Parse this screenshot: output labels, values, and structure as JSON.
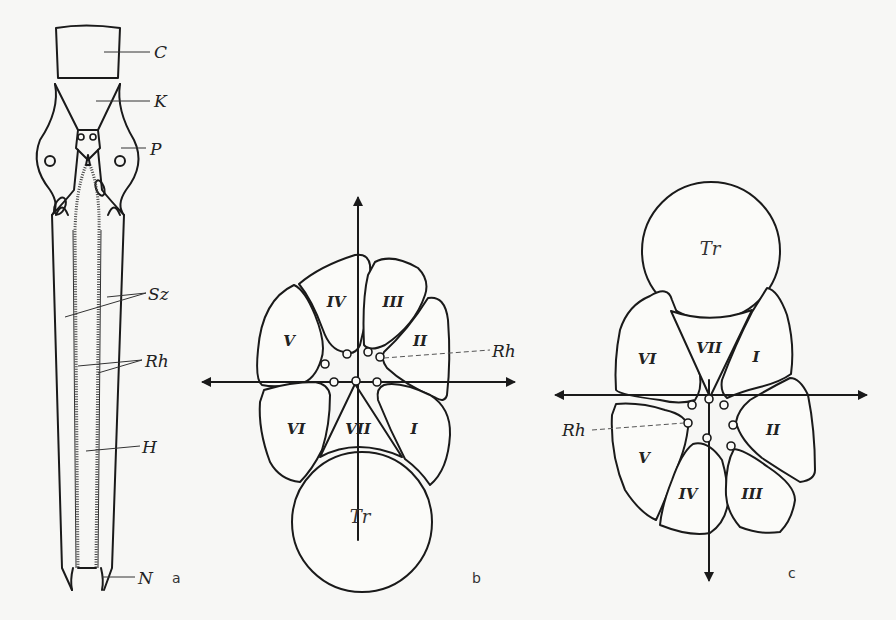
{
  "figure": {
    "panels": {
      "a": {
        "panel_label": "a",
        "labels": {
          "C": "C",
          "K": "K",
          "P": "P",
          "Sz": "Sz",
          "Rh": "Rh",
          "H": "H",
          "N": "N"
        }
      },
      "b": {
        "panel_label": "b",
        "cells": [
          "I",
          "II",
          "III",
          "IV",
          "V",
          "VI",
          "VII"
        ],
        "cell_labels": {
          "I": "I",
          "II": "II",
          "III": "III",
          "IV": "IV",
          "V": "V",
          "VI": "VI",
          "VII": "VII"
        },
        "trunk_label": "Tr",
        "rh_label": "Rh"
      },
      "c": {
        "panel_label": "c",
        "cells": [
          "I",
          "II",
          "III",
          "IV",
          "V",
          "VI",
          "VII"
        ],
        "cell_labels": {
          "I": "I",
          "II": "II",
          "III": "III",
          "IV": "IV",
          "V": "V",
          "VI": "VI",
          "VII": "VII"
        },
        "trunk_label": "Tr",
        "rh_label": "Rh"
      }
    }
  }
}
